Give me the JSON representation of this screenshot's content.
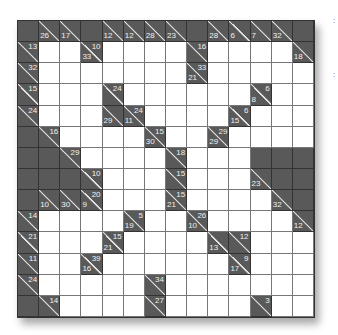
{
  "puzzle": {
    "type": "kakuro",
    "size": 14,
    "legend": "cells: B=black, W=white, clue objects have a=across sum, d=down sum",
    "rows": [
      [
        "B",
        {
          "d": 26
        },
        {
          "d": 17
        },
        "B",
        {
          "d": 12
        },
        {
          "d": 12
        },
        {
          "d": 28
        },
        {
          "d": 23
        },
        "B",
        {
          "d": 28
        },
        {
          "d": 6
        },
        {
          "d": 7
        },
        {
          "d": 32
        },
        "B"
      ],
      [
        {
          "a": 13
        },
        "W",
        "W",
        {
          "a": 10,
          "d": 33
        },
        "W",
        "W",
        "W",
        "W",
        {
          "a": 16
        },
        "W",
        "W",
        "W",
        "W",
        {
          "d": 18
        }
      ],
      [
        {
          "a": 32
        },
        "W",
        "W",
        "W",
        "W",
        "W",
        "W",
        "W",
        {
          "a": 33,
          "d": 21
        },
        "W",
        "W",
        "W",
        "W",
        "W"
      ],
      [
        {
          "a": 15
        },
        "W",
        "W",
        "W",
        {
          "a": 24
        },
        "W",
        "W",
        "W",
        "W",
        "W",
        "W",
        {
          "a": 6,
          "d": 8
        },
        "W",
        "W"
      ],
      [
        {
          "a": 24
        },
        "W",
        "W",
        "W",
        {
          "d": 29
        },
        {
          "a": 24,
          "d": 11
        },
        "W",
        "W",
        "W",
        "W",
        {
          "a": 6,
          "d": 15
        },
        "W",
        "W",
        "W"
      ],
      [
        "B",
        {
          "a": 16
        },
        "W",
        "W",
        "W",
        "W",
        {
          "a": 15,
          "d": 30
        },
        "W",
        "W",
        {
          "a": 29,
          "d": 29
        },
        "W",
        "W",
        "W",
        "W"
      ],
      [
        "B",
        "B",
        {
          "a": 29
        },
        "W",
        "W",
        "W",
        "W",
        {
          "a": 18
        },
        "W",
        "W",
        "W",
        "B",
        "B",
        "B"
      ],
      [
        "B",
        "B",
        "B",
        {
          "a": 10
        },
        "W",
        "W",
        "W",
        {
          "a": 15
        },
        "W",
        "W",
        "W",
        {
          "d": 23
        },
        "B",
        "B"
      ],
      [
        "B",
        {
          "d": 10
        },
        {
          "d": 30
        },
        {
          "a": 20,
          "d": 9
        },
        "W",
        "W",
        "W",
        {
          "a": 15,
          "d": 21
        },
        "W",
        "W",
        "W",
        "W",
        {
          "d": 32
        },
        "B"
      ],
      [
        {
          "a": 14
        },
        "W",
        "W",
        "W",
        "W",
        {
          "a": 5,
          "d": 19
        },
        "W",
        "W",
        {
          "a": 26,
          "d": 10
        },
        "W",
        "W",
        "W",
        "W",
        {
          "d": 12
        }
      ],
      [
        {
          "a": 21
        },
        "W",
        "W",
        "W",
        {
          "a": 15,
          "d": 21
        },
        "W",
        "W",
        "W",
        "W",
        {
          "d": 13
        },
        {
          "a": 12
        },
        "W",
        "W",
        "W"
      ],
      [
        {
          "a": 11
        },
        "W",
        "W",
        {
          "a": 39,
          "d": 16
        },
        "W",
        "W",
        "W",
        "W",
        "W",
        "W",
        {
          "a": 9,
          "d": 17
        },
        "W",
        "W",
        "W"
      ],
      [
        {
          "a": 24
        },
        "W",
        "W",
        "W",
        "W",
        "W",
        {
          "a": 34
        },
        "W",
        "W",
        "W",
        "W",
        "W",
        "W",
        "W"
      ],
      [
        "B",
        {
          "a": 14
        },
        "W",
        "W",
        "W",
        "W",
        {
          "a": 27
        },
        "W",
        "W",
        "W",
        "W",
        {
          "a": 3
        },
        "W",
        "W"
      ]
    ]
  },
  "margin_marks": [
    ":",
    ":"
  ],
  "colors": {
    "black": "#595959",
    "white": "#ffffff",
    "clue_text": "#f0f0f0",
    "grid_line": "#333333"
  }
}
